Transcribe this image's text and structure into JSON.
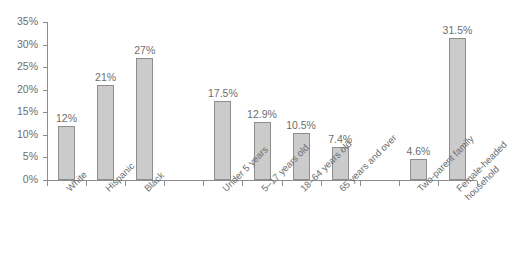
{
  "chart_data": {
    "type": "bar",
    "title": "",
    "subtitle": "",
    "xlabel": "",
    "ylabel": "",
    "ylim": [
      0,
      35
    ],
    "grid": false,
    "legend": null,
    "y_ticks": [
      "0%",
      "5%",
      "10%",
      "15%",
      "20%",
      "25%",
      "30%",
      "35%"
    ],
    "y_tick_values": [
      0,
      5,
      10,
      15,
      20,
      25,
      30,
      35
    ],
    "categories": [
      "White",
      "Hispanic",
      "Black",
      "",
      "Under 5 years",
      "5–17 years old",
      "18–64 years old",
      "65 years and over",
      "",
      "Two-parent family",
      "Female-headed household"
    ],
    "values": [
      12,
      21,
      27,
      null,
      17.5,
      12.9,
      10.5,
      7.4,
      null,
      4.6,
      31.5
    ],
    "data_labels": [
      "12%",
      "21%",
      "27%",
      "",
      "17.5%",
      "12.9%",
      "10.5%",
      "7.4%",
      "",
      "4.6%",
      "31.5%"
    ],
    "bar_color": "#cbcbcb",
    "bar_border_color": "#8e8e8e",
    "axis_color": "#8c8c8c",
    "text_color": "#6d6e70",
    "background": "#ffffff"
  },
  "bars": [
    {
      "label": "White",
      "label_line2": "",
      "value_text": "12%",
      "value": 12,
      "slot": 0
    },
    {
      "label": "Hispanic",
      "label_line2": "",
      "value_text": "21%",
      "value": 21,
      "slot": 1
    },
    {
      "label": "Black",
      "label_line2": "",
      "value_text": "27%",
      "value": 27,
      "slot": 2
    },
    {
      "label": "Under 5 years",
      "label_line2": "",
      "value_text": "17.5%",
      "value": 17.5,
      "slot": 4
    },
    {
      "label": "5–17 years old",
      "label_line2": "",
      "value_text": "12.9%",
      "value": 12.9,
      "slot": 5
    },
    {
      "label": "18–64 years old",
      "label_line2": "",
      "value_text": "10.5%",
      "value": 10.5,
      "slot": 6
    },
    {
      "label": "65 years and over",
      "label_line2": "",
      "value_text": "7.4%",
      "value": 7.4,
      "slot": 7
    },
    {
      "label": "Two-parent family",
      "label_line2": "",
      "value_text": "4.6%",
      "value": 4.6,
      "slot": 9
    },
    {
      "label": "Female-headed",
      "label_line2": "household",
      "value_text": "31.5%",
      "value": 31.5,
      "slot": 10
    }
  ]
}
